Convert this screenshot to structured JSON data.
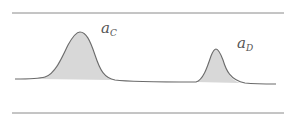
{
  "diagram": {
    "type": "chromatogram-peaks",
    "colors": {
      "rule": "#8a8a8a",
      "curve": "#6b6b6b",
      "fill": "#d8d8d8",
      "label": "#555555"
    },
    "rules": {
      "top_y": 13,
      "bottom_y": 113,
      "x_start": 12,
      "x_end": 284
    },
    "peaks": [
      {
        "id": "C",
        "label_base": "a",
        "label_sub": "C",
        "apex_x": 80,
        "apex_y": 32,
        "label_x": 100,
        "label_y": 22
      },
      {
        "id": "D",
        "label_base": "a",
        "label_sub": "D",
        "apex_x": 216,
        "apex_y": 49,
        "label_x": 236,
        "label_y": 36
      }
    ]
  }
}
